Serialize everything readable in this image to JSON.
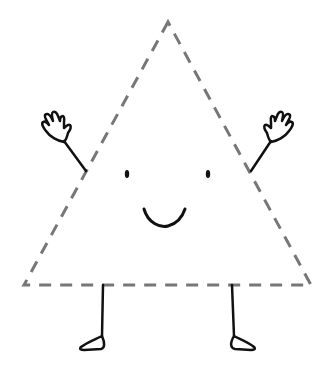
{
  "illustration": {
    "description": "Cartoon triangle character with dashed outline, smiling face, waving hands and legs",
    "colors": {
      "background": "#ffffff",
      "outline_dashed": "#777777",
      "ink": "#111111"
    },
    "triangle": {
      "apex": [
        168,
        22
      ],
      "bottom_left": [
        24,
        285
      ],
      "bottom_right": [
        311,
        285
      ],
      "stroke_style": "dashed"
    },
    "face": {
      "left_eye": [
        127,
        174
      ],
      "right_eye": [
        208,
        174
      ],
      "smile_center": [
        164,
        208
      ]
    }
  }
}
